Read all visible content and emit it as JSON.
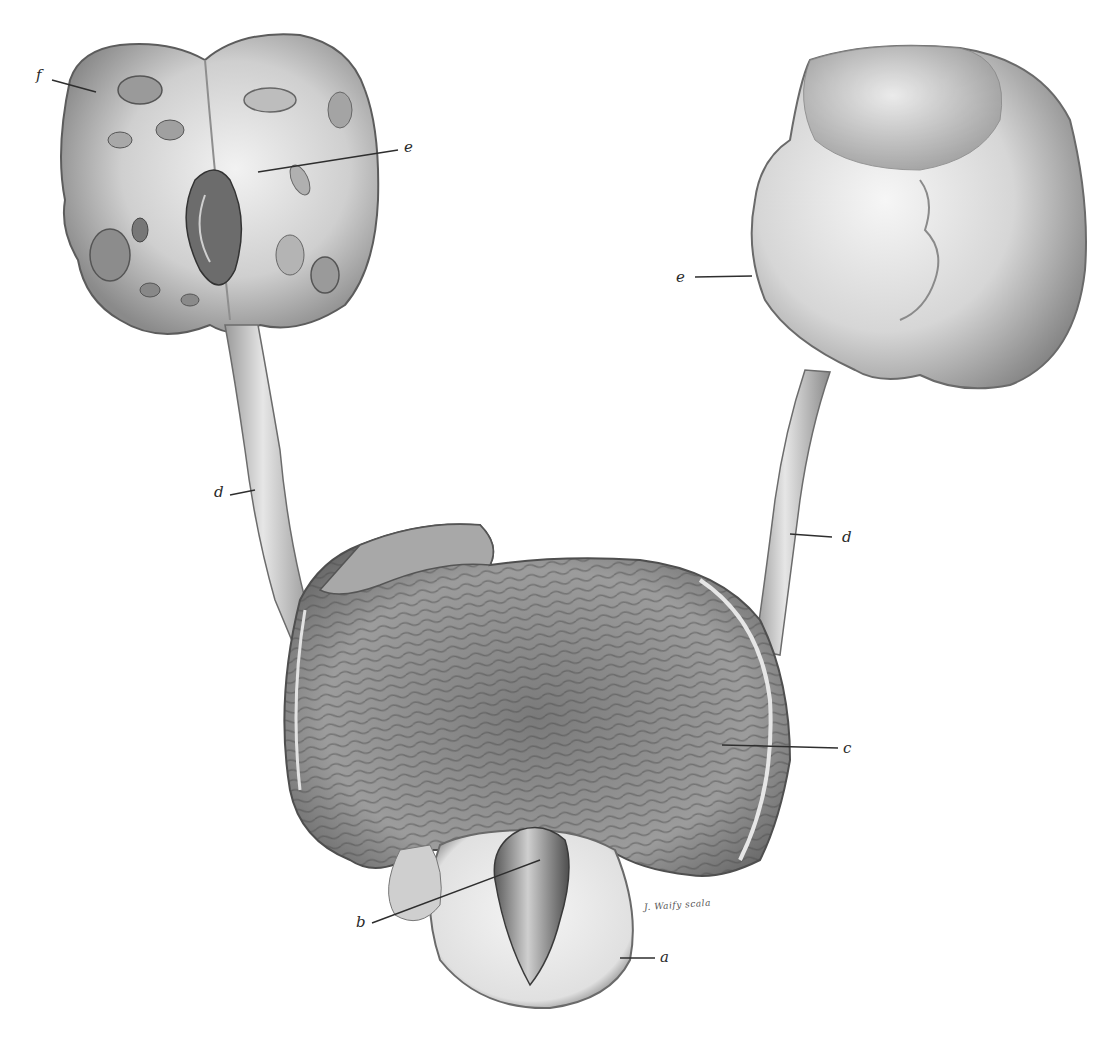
{
  "figure": {
    "type": "anatomical-lithograph",
    "labels": [
      {
        "id": "f",
        "text": "f",
        "target": "left-kidney-cortex"
      },
      {
        "id": "e_left",
        "text": "e",
        "target": "left-kidney-cut-surface"
      },
      {
        "id": "e_right",
        "text": "e",
        "target": "right-kidney-pelvis"
      },
      {
        "id": "d_left",
        "text": "d",
        "target": "left-ureter"
      },
      {
        "id": "d_right",
        "text": "d",
        "target": "right-ureter"
      },
      {
        "id": "c",
        "text": "c",
        "target": "bladder-wall"
      },
      {
        "id": "b",
        "text": "b",
        "target": "prostatic-lobe"
      },
      {
        "id": "a",
        "text": "a",
        "target": "prostate"
      }
    ],
    "signature": "J. Waify scala"
  },
  "colors": {
    "background": "#ffffff",
    "ink_dark": "#3a3a3a",
    "ink_mid": "#7a7a7a",
    "ink_light": "#c8c8c8"
  }
}
